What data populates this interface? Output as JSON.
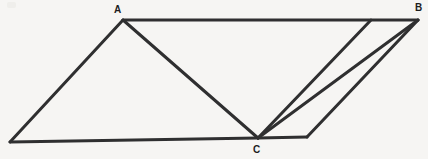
{
  "figure": {
    "background_color": "#f6f5f3",
    "stroke_color": "#2f2f30",
    "stroke_width": 3,
    "label_color": "#1d1d1d",
    "labels": {
      "A": "A",
      "B": "B",
      "C": "C"
    },
    "label_positions": {
      "A": {
        "x": 118,
        "y": 11
      },
      "B": {
        "x": 419,
        "y": 9
      },
      "C": {
        "x": 257,
        "y": 151
      }
    },
    "points": {
      "A": {
        "x": 123,
        "y": 20
      },
      "B": {
        "x": 418,
        "y": 20
      },
      "C": {
        "x": 258,
        "y": 138
      },
      "D": {
        "x": 10,
        "y": 142
      },
      "E": {
        "x": 307,
        "y": 137
      },
      "F": {
        "x": 371,
        "y": 20
      }
    },
    "segments": [
      {
        "name": "top-edge-A-to-B",
        "from": "A",
        "to": "B"
      },
      {
        "name": "left-edge-D-to-A",
        "from": "D",
        "to": "A"
      },
      {
        "name": "bottom-edge-D-to-C",
        "from": "D",
        "to": "C"
      },
      {
        "name": "bottom-edge-C-to-E",
        "from": "C",
        "to": "E"
      },
      {
        "name": "right-edge-E-to-B",
        "from": "E",
        "to": "B"
      },
      {
        "name": "cevian-A-to-C",
        "from": "A",
        "to": "C"
      },
      {
        "name": "cevian-C-to-F",
        "from": "C",
        "to": "F"
      },
      {
        "name": "cevian-C-to-B",
        "from": "C",
        "to": "B"
      }
    ]
  }
}
